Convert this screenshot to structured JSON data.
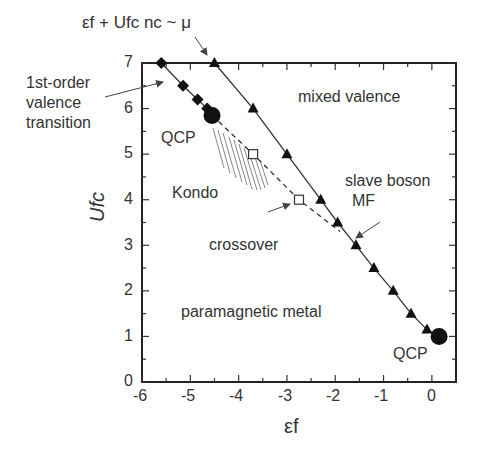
{
  "chart_data": {
    "type": "scatter",
    "title": "",
    "xlabel": "εf",
    "ylabel": "Ufc",
    "xlim": [
      -6,
      0.5
    ],
    "ylim": [
      0,
      7
    ],
    "xticks": [
      -6,
      -5,
      -4,
      -3,
      -2,
      -1,
      0
    ],
    "yticks": [
      0,
      1,
      2,
      3,
      4,
      5,
      6,
      7
    ],
    "grid": false,
    "series": [
      {
        "name": "1st-order valence transition",
        "marker": "filled-diamond",
        "line": "solid",
        "x": [
          -5.6,
          -5.15,
          -4.85,
          -4.65
        ],
        "y": [
          7.0,
          6.5,
          6.2,
          6.0
        ]
      },
      {
        "name": "QCP",
        "marker": "large-filled-circle",
        "x": [
          -4.55,
          0.15
        ],
        "y": [
          5.85,
          1.0
        ]
      },
      {
        "name": "crossover",
        "marker": "open-square",
        "line": "dashed",
        "x": [
          -4.55,
          -3.7,
          -2.75,
          -1.9
        ],
        "y": [
          5.85,
          5.0,
          4.0,
          3.3
        ]
      },
      {
        "name": "slave boson MF",
        "marker": "filled-triangle",
        "line": "solid",
        "x": [
          -4.5,
          -3.7,
          -3.0,
          -2.3,
          -1.95,
          -1.57,
          -1.2,
          -0.8,
          -0.43,
          -0.1,
          0.15
        ],
        "y": [
          7.0,
          6.0,
          5.0,
          4.0,
          3.5,
          3.0,
          2.5,
          2.0,
          1.5,
          1.15,
          1.0
        ]
      }
    ],
    "annotations": [
      "εf + Ufc nc ~ μ",
      "1st-order valence transition",
      "QCP",
      "Kondo",
      "crossover",
      "mixed valence",
      "slave boson MF",
      "paramagnetic metal",
      "QCP"
    ]
  },
  "labels": {
    "top_formula": "εf + Ufc nc ~ μ",
    "first_order_1": "1st-order",
    "first_order_2": "valence",
    "first_order_3": "transition",
    "qcp_upper": "QCP",
    "kondo": "Kondo",
    "crossover": "crossover",
    "mixed_valence": "mixed valence",
    "slave_boson_1": "slave boson",
    "slave_boson_2": "MF",
    "paramagnetic": "paramagnetic metal",
    "qcp_lower": "QCP",
    "xlabel": "εf",
    "ylabel": "Ufc"
  },
  "ticks": {
    "x": [
      "-6",
      "-5",
      "-4",
      "-3",
      "-2",
      "-1",
      "0"
    ],
    "y": [
      "0",
      "1",
      "2",
      "3",
      "4",
      "5",
      "6",
      "7"
    ]
  }
}
